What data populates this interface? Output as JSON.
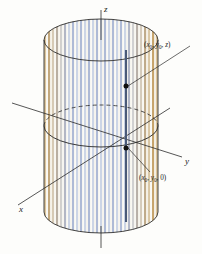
{
  "figure": {
    "name": "cylinder-coordinate-diagram",
    "background_color": "#fdfdfb"
  },
  "axes": {
    "z": {
      "label": "z",
      "color": "#2b2b2b"
    },
    "y": {
      "label": "y",
      "color": "#2b2b2b"
    },
    "x": {
      "label": "x",
      "color": "#2b2b2b"
    }
  },
  "points": [
    {
      "id": "upper-point",
      "label_text": "(x0, y0, z)",
      "label_parts": {
        "open": "(",
        "var1": "x",
        "sub1": "0",
        "sep1": ", ",
        "var2": "y",
        "sub2": "0",
        "sep2": ", ",
        "var3": "z",
        "close": ")"
      },
      "marker_color": "#111111"
    },
    {
      "id": "lower-point",
      "label_text": "(x0, y0, 0)",
      "label_parts": {
        "open": "(",
        "var1": "x",
        "sub1": "0",
        "sep1": ", ",
        "var2": "y",
        "sub2": "0",
        "sep2": ", ",
        "var3": "0",
        "close": ")"
      },
      "marker_color": "#111111"
    }
  ],
  "cylinder": {
    "stripe_colors": {
      "tan": "#c8a46a",
      "tan_light": "#ddc59a",
      "blue": "#aebad6",
      "blue_light": "#ccd5e6",
      "cream": "#f3efe4",
      "white": "#fbfaf6"
    },
    "outline_color": "#2f2f2f",
    "ruling_line_color": "#4a5a78",
    "ruling_line_name": "highlighted-vertical-ruling"
  },
  "leaders": {
    "upper_leader_color": "#2b2b2b",
    "lower_leader_color": "#2b2b2b"
  }
}
